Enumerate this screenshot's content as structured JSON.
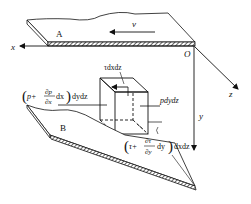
{
  "diagram": {
    "plates": {
      "top_label": "A",
      "bottom_label": "B"
    },
    "velocity_label": "v",
    "axes": {
      "origin": "O",
      "x": "x",
      "y": "y",
      "z": "z"
    },
    "forces": {
      "top_shear": "τdxdz",
      "right_pressure": "pdydz",
      "left_pressure": {
        "open": "(",
        "p": "p+",
        "num": "∂p",
        "den": "∂x",
        "dx": "dx",
        "close": ")",
        "tail": "dydz"
      },
      "bottom_shear": {
        "open": "(",
        "tau": "τ+",
        "num": "∂τ",
        "den": "∂y",
        "dy": "dy",
        "close": ")",
        "tail": "dxdz"
      }
    },
    "colors": {
      "ink": "#111111",
      "background": "#ffffff"
    }
  }
}
